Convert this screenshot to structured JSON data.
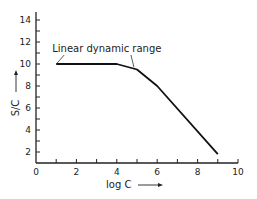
{
  "chart_data": {
    "type": "line",
    "title": "",
    "xlabel": "log C",
    "ylabel": "S/C",
    "xlim": [
      0,
      10
    ],
    "ylim": [
      1,
      15
    ],
    "xticks": [
      0,
      2,
      4,
      6,
      8,
      10
    ],
    "yticks": [
      2,
      4,
      6,
      8,
      10,
      12,
      14
    ],
    "grid": false,
    "legend": null,
    "series": [
      {
        "name": "S/C vs log C",
        "x": [
          1,
          4,
          5,
          6,
          9
        ],
        "y": [
          10,
          10,
          9.5,
          8,
          1.8
        ]
      }
    ],
    "annotations": [
      {
        "text": "Linear dynamic range",
        "spans_x": [
          1,
          5
        ]
      }
    ]
  },
  "labels": {
    "x_axis": "log C",
    "y_axis": "S/C",
    "annotation": "Linear dynamic range"
  },
  "ticks": {
    "x": [
      "0",
      "2",
      "4",
      "6",
      "8",
      "10"
    ],
    "y": [
      "14",
      "12",
      "10",
      "8",
      "6",
      "4",
      "2"
    ]
  }
}
